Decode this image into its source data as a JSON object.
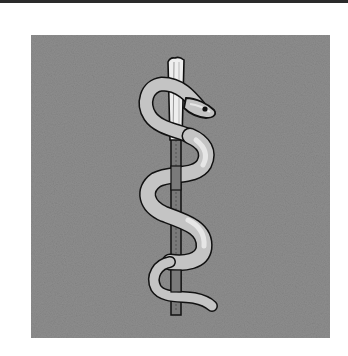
{
  "figure": {
    "subject": "Rod of Asclepius",
    "colors": {
      "background": "#ffffff",
      "panel": "#8e8e8e",
      "top_rule": "#2a2a2a",
      "snake_fill": "#c4c4c4",
      "snake_highlight": "#e6e6e6",
      "staff_fill": "#7a7a7a",
      "staff_top_fill": "#eeeeee",
      "outline": "#111111"
    }
  }
}
